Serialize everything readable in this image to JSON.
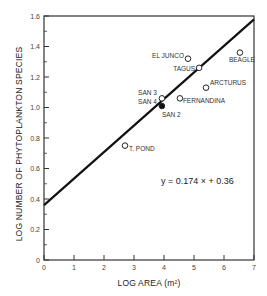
{
  "chart_data": {
    "type": "scatter",
    "title": "",
    "xlabel": "LOG AREA (m²)",
    "ylabel": "LOG NUMBER OF PHYTOPLANKTON SPECIES",
    "xlim": [
      0,
      7
    ],
    "ylim": [
      0,
      1.6
    ],
    "x_ticks": [
      "0",
      "1",
      "2",
      "3",
      "4",
      "5",
      "6",
      "7"
    ],
    "y_ticks": [
      "0",
      "0.2",
      "0.4",
      "0.6",
      "0.8",
      "1.0",
      "1.2",
      "1.4",
      "1.6"
    ],
    "grid": false,
    "legend": null,
    "points": [
      {
        "label": "T. POND",
        "x": 2.7,
        "y": 0.75,
        "marker": "open"
      },
      {
        "label": "SAN 3",
        "x": 3.93,
        "y": 1.06,
        "marker": "open"
      },
      {
        "label": "SAN 4",
        "x": 3.93,
        "y": 1.05,
        "marker": "open"
      },
      {
        "label": "SAN 2",
        "x": 3.93,
        "y": 1.01,
        "marker": "filled"
      },
      {
        "label": "FERNANDINA",
        "x": 4.53,
        "y": 1.06,
        "marker": "open"
      },
      {
        "label": "ARCTURUS",
        "x": 5.4,
        "y": 1.13,
        "marker": "open"
      },
      {
        "label": "TAGUS",
        "x": 5.17,
        "y": 1.26,
        "marker": "open"
      },
      {
        "label": "EL JUNCO",
        "x": 4.8,
        "y": 1.32,
        "marker": "open"
      },
      {
        "label": "BEAGLE",
        "x": 6.53,
        "y": 1.36,
        "marker": "open"
      }
    ],
    "regression": {
      "slope": 0.174,
      "intercept": 0.36,
      "equation": "y = 0.174 × + 0.36"
    }
  },
  "labels": {
    "xlabel": "LOG AREA (m²)",
    "ylabel": "LOG NUMBER OF PHYTOPLANKTON SPECIES",
    "equation": "y = 0.174 × + 0.36"
  }
}
